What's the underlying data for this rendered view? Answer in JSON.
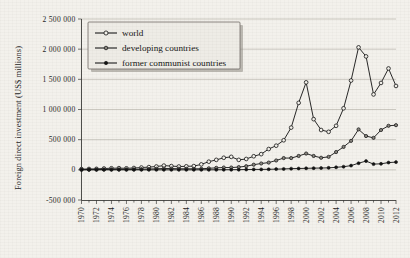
{
  "chart_data": {
    "type": "line",
    "title": "",
    "xlabel": "",
    "ylabel": "Foreign direct investment (US$ millions)",
    "grid": true,
    "legend_position": "top-left",
    "xlim": [
      1970,
      2012
    ],
    "ylim": [
      -500000,
      2500000
    ],
    "ytick_labels": [
      "2 500 000",
      "2 000 000",
      "1 500 000",
      "1 000 000",
      "500 000",
      "0",
      "-500 000"
    ],
    "ytick_values": [
      2500000,
      2000000,
      1500000,
      1000000,
      500000,
      0,
      -500000
    ],
    "xtick_labels": [
      "1970",
      "1972",
      "1974",
      "1976",
      "1978",
      "1980",
      "1982",
      "1984",
      "1986",
      "1988",
      "1990",
      "1992",
      "1994",
      "1996",
      "1998",
      "2000",
      "2002",
      "2004",
      "2006",
      "2008",
      "2010",
      "2012"
    ],
    "x": [
      1970,
      1971,
      1972,
      1973,
      1974,
      1975,
      1976,
      1977,
      1978,
      1979,
      1980,
      1981,
      1982,
      1983,
      1984,
      1985,
      1986,
      1987,
      1988,
      1989,
      1990,
      1991,
      1992,
      1993,
      1994,
      1995,
      1996,
      1997,
      1998,
      1999,
      2000,
      2001,
      2002,
      2003,
      2004,
      2005,
      2006,
      2007,
      2008,
      2009,
      2010,
      2011,
      2012
    ],
    "series": [
      {
        "name": "world",
        "marker": "open-circle",
        "values": [
          12000,
          14000,
          16000,
          22000,
          26000,
          28000,
          25000,
          30000,
          38000,
          45000,
          55000,
          70000,
          62000,
          55000,
          58000,
          62000,
          90000,
          135000,
          165000,
          200000,
          215000,
          165000,
          180000,
          225000,
          260000,
          345000,
          400000,
          490000,
          700000,
          1110000,
          1450000,
          840000,
          660000,
          630000,
          730000,
          1020000,
          1480000,
          2030000,
          1880000,
          1250000,
          1440000,
          1680000,
          1390000
        ]
      },
      {
        "name": "developing countries",
        "marker": "half-circle",
        "values": [
          3500,
          4000,
          4500,
          6000,
          7000,
          8000,
          7000,
          8500,
          11000,
          14000,
          17000,
          22000,
          21000,
          18000,
          17000,
          17000,
          18000,
          25000,
          33000,
          38000,
          38000,
          45000,
          60000,
          85000,
          105000,
          120000,
          155000,
          195000,
          195000,
          230000,
          270000,
          230000,
          200000,
          215000,
          295000,
          380000,
          480000,
          670000,
          560000,
          530000,
          660000,
          730000,
          740000
        ]
      },
      {
        "name": "former communist countries",
        "marker": "solid-circle",
        "values": [
          0,
          0,
          0,
          0,
          0,
          0,
          0,
          0,
          0,
          0,
          0,
          0,
          0,
          0,
          0,
          0,
          200,
          500,
          1000,
          1500,
          2000,
          3000,
          5000,
          7000,
          7000,
          9000,
          12000,
          15000,
          20000,
          22000,
          25000,
          28000,
          30000,
          33000,
          42000,
          52000,
          70000,
          110000,
          145000,
          95000,
          100000,
          120000,
          128000
        ]
      }
    ]
  },
  "legend": {
    "items": [
      {
        "label": "world"
      },
      {
        "label": "developing countries"
      },
      {
        "label": "former communist countries"
      }
    ]
  }
}
